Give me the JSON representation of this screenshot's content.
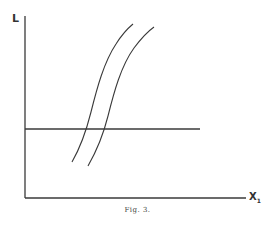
{
  "figure": {
    "caption": "Fig. 3.",
    "y_axis_label": "L",
    "x_axis_label": "X",
    "x_axis_subscript": "1",
    "line_color": "#3a3a3a"
  },
  "elements": {
    "horizontal_line": {
      "y": 129,
      "x_start": 25,
      "x_end": 200
    },
    "curves": [
      {
        "name": "curve-1",
        "bottom": [
          72,
          162
        ],
        "top": [
          133,
          24
        ]
      },
      {
        "name": "curve-2",
        "bottom": [
          88,
          166
        ],
        "top": [
          154,
          27
        ]
      }
    ]
  }
}
